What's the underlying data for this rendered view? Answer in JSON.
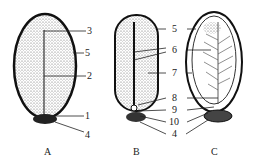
{
  "figure": {
    "captions": {
      "A": "A",
      "B": "B",
      "C": "C"
    },
    "panel_a": {
      "labels": {
        "l3": "3",
        "l5": "5",
        "l2": "2",
        "l1": "1",
        "l4": "4"
      }
    },
    "panel_bc": {
      "labels": {
        "l5": "5",
        "l6": "6",
        "l7": "7",
        "l8": "8",
        "l9": "9",
        "l10": "10",
        "l4": "4"
      }
    },
    "colors": {
      "ink": "#222222",
      "background": "#ffffff"
    }
  }
}
